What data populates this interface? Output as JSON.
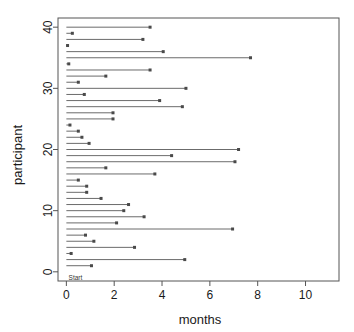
{
  "chart_data": {
    "type": "line",
    "title": "",
    "subtitle": "",
    "xlabel": "months",
    "ylabel": "participant",
    "xlim": [
      -0.35,
      11.4
    ],
    "ylim": [
      -1.5,
      41.5
    ],
    "xticks": [
      0,
      2,
      4,
      6,
      8,
      10
    ],
    "xticklabels": [
      "0",
      "2",
      "4",
      "6",
      "8",
      "10"
    ],
    "yticks": [
      0,
      10,
      20,
      30,
      40
    ],
    "yticklabels": [
      "0",
      "10",
      "20",
      "30",
      "40"
    ],
    "grid": false,
    "legend": null,
    "annotations": [
      {
        "text": "Start",
        "x": 0.05,
        "y": 0.0,
        "align": "left"
      }
    ],
    "series": [
      {
        "name": "follow-up duration",
        "description": "Horizontal segment per participant from start (0 months) to last observation, with a point marker at the end.",
        "start_value": 0,
        "participants": [
          40,
          39,
          38,
          37,
          36,
          35,
          34,
          33,
          32,
          31,
          30,
          29,
          28,
          27,
          26,
          25,
          24,
          23,
          22,
          21,
          20,
          19,
          18,
          17,
          16,
          15,
          14,
          13,
          12,
          11,
          10,
          9,
          8,
          7,
          6,
          5,
          4,
          3,
          2,
          1
        ],
        "end_values": [
          3.5,
          0.25,
          3.2,
          0.05,
          4.05,
          7.7,
          0.1,
          3.5,
          1.65,
          0.5,
          5.0,
          0.75,
          3.9,
          4.85,
          1.95,
          1.95,
          0.15,
          0.5,
          0.65,
          0.95,
          7.2,
          4.4,
          7.05,
          1.65,
          3.7,
          0.5,
          0.85,
          0.85,
          1.45,
          2.6,
          2.4,
          3.25,
          2.1,
          6.95,
          0.8,
          1.15,
          2.85,
          0.2,
          4.95,
          1.05
        ]
      }
    ]
  },
  "figure": {
    "axis_label_x": "months",
    "axis_label_y": "participant",
    "start_label": "Start"
  }
}
